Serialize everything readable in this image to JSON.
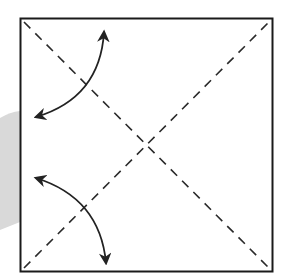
{
  "diagram": {
    "type": "origami-fold-diagram",
    "colors": {
      "background": "#ffffff",
      "outline": "#1a1a1a",
      "fold_line": "#2a2a2a",
      "arrow": "#222222",
      "shadow": "#d9d9d9"
    },
    "square": {
      "x": 20,
      "y": 18,
      "size": 253
    },
    "fold_lines": [
      {
        "name": "diagonal-top-left-to-bottom-right",
        "style": "dashed"
      },
      {
        "name": "diagonal-bottom-left-to-top-right",
        "style": "dashed"
      }
    ],
    "arrows": [
      {
        "name": "upper-fold-arrow",
        "style": "curved-double-headed"
      },
      {
        "name": "lower-fold-arrow",
        "style": "curved-double-headed"
      }
    ]
  }
}
